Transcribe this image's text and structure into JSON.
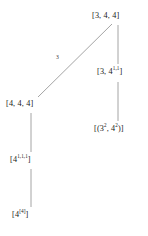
{
  "diagram": {
    "type": "hasse-lattice-diagram",
    "line_color": "#9a9a9a",
    "text_color": "#1a1a1a",
    "background": "#ffffff",
    "nodes": [
      {
        "id": "root",
        "label": "[3, 4, 4]",
        "base": "[3, 4, 4]",
        "superscript": "",
        "x": 118,
        "y": 18
      },
      {
        "id": "right-mid",
        "label": "[3, 4^1,1]",
        "base_pre": "[3, 4",
        "superscript": "1,1",
        "base_post": "]",
        "x": 118,
        "y": 74
      },
      {
        "id": "right-low",
        "label": "[(3^2, 4^2)]",
        "base_pre": "[(3",
        "superscript": "2",
        "base_mid": ", 4",
        "superscript2": "2",
        "base_post": ")]",
        "x": 118,
        "y": 131
      },
      {
        "id": "left-top",
        "label": "[4, 4, 4]",
        "base": "[4, 4, 4]",
        "superscript": "",
        "x": 31,
        "y": 106
      },
      {
        "id": "left-mid",
        "label": "[4^1,1,1]",
        "base_pre": "[4",
        "superscript": "1,1,1",
        "base_post": "]",
        "x": 31,
        "y": 162
      },
      {
        "id": "left-bottom",
        "label": "[4^[4]]",
        "base_pre": "[4",
        "superscript": "[4]",
        "base_post": "]",
        "x": 31,
        "y": 217
      }
    ],
    "edges": [
      {
        "id": "root-to-left-top",
        "from": "root",
        "to": "left-top",
        "label": "3",
        "orientation": "diagonal"
      },
      {
        "id": "root-to-right-mid",
        "from": "root",
        "to": "right-mid",
        "label": "",
        "orientation": "vertical"
      },
      {
        "id": "right-mid-to-right-low",
        "from": "right-mid",
        "to": "right-low",
        "label": "",
        "orientation": "vertical"
      },
      {
        "id": "left-top-to-left-mid",
        "from": "left-top",
        "to": "left-mid",
        "label": "",
        "orientation": "vertical"
      },
      {
        "id": "left-mid-to-left-bottom",
        "from": "left-mid",
        "to": "left-bottom",
        "label": "",
        "orientation": "vertical"
      }
    ],
    "edge_labels": {
      "diagonal_3": "3"
    }
  }
}
